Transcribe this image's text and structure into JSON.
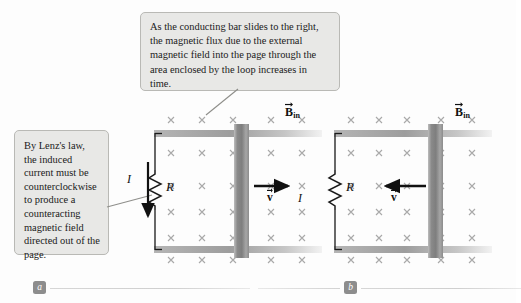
{
  "figure": {
    "background_color": "#fdfdfd"
  },
  "callouts": [
    {
      "id": "top",
      "text": "As the conducting bar slides to the right, the magnetic flux due to the external magnetic field into the page through the area enclosed by the loop increases in time.",
      "background_color": "#e8e8e6",
      "border_color": "#b9b9b5",
      "points_to": "sliding-bar-panel-a"
    },
    {
      "id": "left",
      "text": "By Lenz's law, the induced current must be counterclockwise to produce a counteracting magnetic field directed out of the page.",
      "background_color": "#e8e8e6",
      "border_color": "#b9b9b5",
      "points_to": "current-arrow-panel-a"
    }
  ],
  "panels": [
    {
      "id": "a",
      "part_label": "a",
      "field_label": {
        "symbol": "B",
        "subscript": "in",
        "vector": true
      },
      "field_marks": "x",
      "resistor_label": "R",
      "current_label": "I",
      "current_direction": "down",
      "velocity_label": {
        "symbol": "v",
        "vector": true
      },
      "velocity_direction": "right",
      "bar_position": "middle"
    },
    {
      "id": "b",
      "part_label": "b",
      "field_label": {
        "symbol": "B",
        "subscript": "in",
        "vector": true
      },
      "field_marks": "x",
      "resistor_label": "R",
      "current_label": "I",
      "current_direction": "up",
      "velocity_label": {
        "symbol": "v",
        "vector": true
      },
      "velocity_direction": "left",
      "bar_position": "right"
    }
  ],
  "colors": {
    "rail_gray": "#9a9a9a",
    "bar_gray": "#8f8f8f",
    "field_mark_gray": "#a8a8a8",
    "wire_black": "#1a1a1a",
    "badge_gray": "#8d8d8d"
  }
}
